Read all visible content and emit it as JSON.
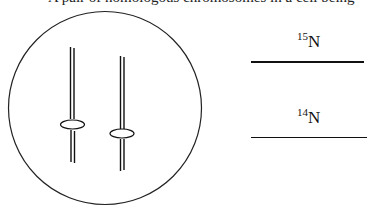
{
  "caption": {
    "text": "A pair of homologous chromosomes in a cell being"
  },
  "cell": {
    "shape": "circle",
    "chromosomes": [
      {
        "name": "chromosome-1",
        "centromere": "ellipse"
      },
      {
        "name": "chromosome-2",
        "centromere": "ellipse"
      }
    ]
  },
  "legend": {
    "items": [
      {
        "isotope_mass": "15",
        "element": "N",
        "line_style": "thick"
      },
      {
        "isotope_mass": "14",
        "element": "N",
        "line_style": "thin"
      }
    ]
  },
  "colors": {
    "stroke": "#111111",
    "background": "#ffffff"
  }
}
